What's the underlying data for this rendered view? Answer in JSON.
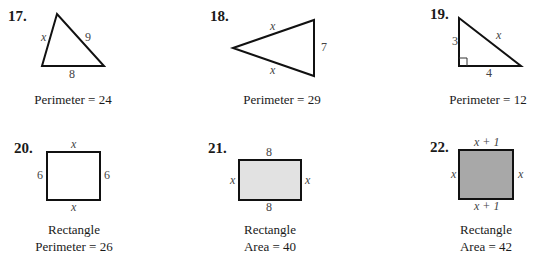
{
  "problems": [
    {
      "number": "17.",
      "shape": "triangle",
      "sides": {
        "left": "x",
        "right": "9",
        "bottom": "8"
      },
      "caption": [
        "Perimeter = 24"
      ]
    },
    {
      "number": "18.",
      "shape": "triangle",
      "sides": {
        "top": "x",
        "right": "7",
        "bottom": "x"
      },
      "caption": [
        "Perimeter = 29"
      ]
    },
    {
      "number": "19.",
      "shape": "right-triangle",
      "sides": {
        "left": "3",
        "hypotenuse": "x",
        "bottom": "4"
      },
      "caption": [
        "Perimeter = 12"
      ]
    },
    {
      "number": "20.",
      "shape": "rectangle",
      "sides": {
        "top": "x",
        "left": "6",
        "right": "6",
        "bottom": "x"
      },
      "caption": [
        "Rectangle",
        "Perimeter = 26"
      ]
    },
    {
      "number": "21.",
      "shape": "rectangle",
      "sides": {
        "top": "8",
        "left": "x",
        "right": "x",
        "bottom": "8"
      },
      "caption": [
        "Rectangle",
        "Area = 40"
      ]
    },
    {
      "number": "22.",
      "shape": "rectangle",
      "sides": {
        "top": "x + 1",
        "left": "x",
        "right": "x",
        "bottom": "x + 1"
      },
      "caption": [
        "Rectangle",
        "Area = 42"
      ]
    }
  ],
  "colors": {
    "stroke": "#111111",
    "fill_light": "#e2e2e2",
    "fill_dark": "#a8a8a8"
  }
}
